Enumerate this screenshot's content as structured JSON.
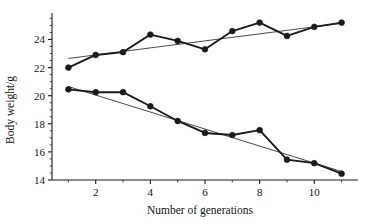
{
  "chart_data": {
    "type": "line",
    "title": "",
    "subtitle": "",
    "xlabel": "Number of generations",
    "ylabel": "Body weight/g",
    "x": [
      1,
      2,
      3,
      4,
      5,
      6,
      7,
      8,
      9,
      10,
      11
    ],
    "xlim": [
      0.4,
      11.6
    ],
    "ylim": [
      14,
      25.6
    ],
    "xticks": [
      2,
      4,
      6,
      8,
      10
    ],
    "xtick_labels": [
      "2",
      "4",
      "6",
      "8",
      "10"
    ],
    "xminorticks": [
      1,
      3,
      5,
      7,
      9,
      11
    ],
    "yticks": [
      14,
      16,
      18,
      20,
      22,
      24
    ],
    "ytick_labels": [
      "14",
      "16",
      "18",
      "20",
      "22",
      "24"
    ],
    "grid": false,
    "legend": "none",
    "marker": "filled-circle",
    "series": [
      {
        "name": "upward-selected-line",
        "values": [
          22.0,
          22.9,
          23.1,
          24.35,
          23.9,
          23.3,
          24.6,
          25.2,
          24.25,
          24.9,
          25.2
        ],
        "color": "#1a1a1a"
      },
      {
        "name": "downward-selected-line",
        "values": [
          20.45,
          20.25,
          20.25,
          19.25,
          18.2,
          17.35,
          17.2,
          17.55,
          15.45,
          15.2,
          14.45
        ],
        "color": "#1a1a1a"
      }
    ],
    "trendlines": [
      {
        "name": "upward-regression-line",
        "x_start": 1,
        "y_start": 22.65,
        "x_end": 11,
        "y_end": 25.15,
        "color": "#1a1a1a"
      },
      {
        "name": "downward-regression-line",
        "x_start": 1,
        "y_start": 20.65,
        "x_end": 11,
        "y_end": 14.6,
        "color": "#1a1a1a"
      }
    ],
    "axis_color": "#1a1a1a",
    "background": "#ffffff"
  },
  "axes": {
    "y_title": "Body weight/g",
    "x_title": "Number of generations"
  }
}
